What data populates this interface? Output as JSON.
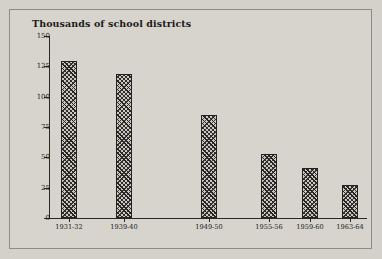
{
  "figure": {
    "background_color": "#d6d4cd",
    "frame_color": "#8e8c86",
    "axis_color": "#2a2824",
    "bar_fill_color": "#c9c7c0",
    "bar_hatch_color": "#262422"
  },
  "chart_data": {
    "type": "bar",
    "title": "Thousands of school districts",
    "xlabel": "",
    "ylabel": "",
    "ylim": [
      0,
      150
    ],
    "yticks": [
      0,
      25,
      50,
      75,
      100,
      125,
      150
    ],
    "ytick_labels": [
      "0",
      "25",
      "50",
      "75",
      "100",
      "125",
      "150"
    ],
    "grid": false,
    "legend": null,
    "categories": [
      "1931-32",
      "1939-40",
      "1949-50",
      "1955-56",
      "1959-60",
      "1963-64"
    ],
    "values": [
      129,
      119,
      85,
      53,
      41,
      27
    ],
    "bar_hatch": "crosshatch-diagonal"
  }
}
